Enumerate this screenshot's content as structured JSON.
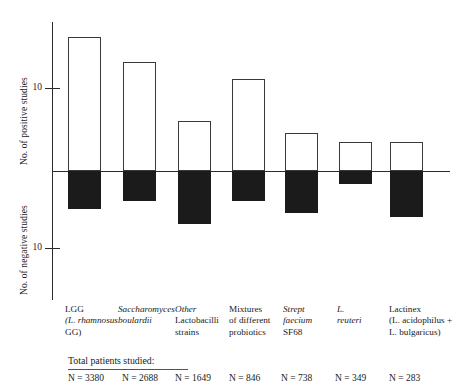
{
  "chart_data": {
    "type": "bar",
    "title": "",
    "subtitle": "",
    "orientation": "vertical",
    "grid": false,
    "legend": null,
    "xlabel": "",
    "ylabel_positive": "No. of positive studies",
    "ylabel_negative": "No. of negative studies",
    "y_axis": {
      "positive_ticks": [
        10
      ],
      "negative_ticks": [
        10
      ],
      "positive_tick_labels": [
        "10"
      ],
      "negative_tick_labels": [
        "10"
      ],
      "ylim_positive": [
        0,
        17
      ],
      "ylim_negative": [
        0,
        12
      ]
    },
    "categories": [
      "LGG (L. rhamnosus GG)",
      "Saccharomyces boulardii",
      "Other Lactobacilli strains",
      "Mixtures of different probiotics",
      "Strept faecium SF68",
      "L. reuteri",
      "Lactinex (L. acidophilus + L. bulgaricus)"
    ],
    "series": [
      {
        "name": "No. of positive studies",
        "values": [
          16,
          13,
          6,
          11,
          4.5,
          3.5,
          3.5
        ]
      },
      {
        "name": "No. of negative studies",
        "values": [
          5,
          4,
          7,
          4,
          5.5,
          1.7,
          6
        ]
      }
    ],
    "patients_label": "Total patients studied:",
    "patients": [
      "N = 3380",
      "N = 2688",
      "N = 1649",
      "N = 846",
      "N = 738",
      "N = 349",
      "N = 283"
    ]
  },
  "axis": {
    "positive_label": "No. of positive studies",
    "negative_label": "No. of negative studies",
    "tick_pos": "10",
    "tick_neg": "10"
  },
  "xlabels": [
    {
      "l1": "LGG",
      "l2": "(L. rhamnosus",
      "l3": "GG)",
      "l2_italic": true,
      "l3_italic": false
    },
    {
      "l1": "Saccharomyces",
      "l2": "boulardii",
      "l3": "",
      "l1_italic": true,
      "l2_italic": true
    },
    {
      "l1": "Other",
      "l2": "Lactobacilli",
      "l3": "strains",
      "l1_italic": true
    },
    {
      "l1": "Mixtures",
      "l2": "of different",
      "l3": "probiotics"
    },
    {
      "l1": "Strept",
      "l2": "faecium",
      "l3": "SF68",
      "l1_italic": true,
      "l2_italic": true
    },
    {
      "l1": "L.",
      "l2": "reuteri",
      "l3": "",
      "l1_italic": true,
      "l2_italic": true
    },
    {
      "l1": "Lactinex",
      "l2": "(L. acidophilus +",
      "l3": "L. bulgaricus)"
    }
  ],
  "footer": {
    "title": "Total patients studied:",
    "values": [
      "N = 3380",
      "N = 2688",
      "N = 1649",
      "N = 846",
      "N = 738",
      "N = 349",
      "N = 283"
    ]
  },
  "colors": {
    "positive_bar_fill": "#ffffff",
    "positive_bar_stroke": "#3a3a3a",
    "negative_bar_fill": "#1b1b1b",
    "axis": "#2b2b2b",
    "text": "#1a1a1a",
    "background": "#ffffff"
  }
}
